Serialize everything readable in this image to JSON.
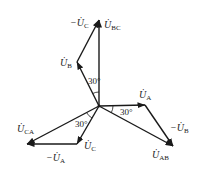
{
  "diagram": {
    "type": "phasor-diagram",
    "origin": [
      99,
      106
    ],
    "vectors": [
      {
        "id": "U_BC",
        "from": [
          99,
          106
        ],
        "to": [
          99,
          20
        ],
        "label_main": "U̇",
        "label_sub": "BC",
        "label_pos": [
          104,
          28
        ]
      },
      {
        "id": "U_B",
        "from": [
          99,
          106
        ],
        "to": [
          77,
          62
        ],
        "label_main": "U̇",
        "label_sub": "B",
        "label_pos": [
          60,
          66
        ]
      },
      {
        "id": "neg_U_C",
        "from": [
          77,
          62
        ],
        "to": [
          99,
          20
        ],
        "label_main": "−U̇",
        "label_sub": "C",
        "label_pos": [
          70,
          26
        ]
      },
      {
        "id": "U_A",
        "from": [
          99,
          106
        ],
        "to": [
          145,
          105
        ],
        "label_main": "U̇",
        "label_sub": "A",
        "label_pos": [
          139,
          98
        ]
      },
      {
        "id": "U_AB",
        "from": [
          99,
          106
        ],
        "to": [
          173,
          146
        ],
        "label_main": "U̇",
        "label_sub": "AB",
        "label_pos": [
          152,
          158
        ]
      },
      {
        "id": "neg_U_B",
        "from": [
          145,
          105
        ],
        "to": [
          173,
          146
        ],
        "label_main": "−U̇",
        "label_sub": "B",
        "label_pos": [
          170,
          131
        ]
      },
      {
        "id": "U_C",
        "from": [
          99,
          106
        ],
        "to": [
          77,
          144
        ],
        "label_main": "U̇",
        "label_sub": "C",
        "label_pos": [
          84,
          149
        ]
      },
      {
        "id": "U_CA",
        "from": [
          99,
          106
        ],
        "to": [
          27,
          144
        ],
        "label_main": "U̇",
        "label_sub": "CA",
        "label_pos": [
          17,
          132
        ]
      },
      {
        "id": "neg_U_A",
        "from": [
          77,
          144
        ],
        "to": [
          27,
          144
        ],
        "label_main": "−U̇",
        "label_sub": "A",
        "label_pos": [
          46,
          161
        ]
      }
    ],
    "angles": [
      {
        "label": "30°",
        "between": [
          "U_B",
          "U_BC"
        ],
        "pos": [
          88,
          84
        ]
      },
      {
        "label": "30°",
        "between": [
          "U_A",
          "U_AB"
        ],
        "pos": [
          120,
          115
        ]
      },
      {
        "label": "30°",
        "between": [
          "U_C",
          "U_CA"
        ],
        "pos": [
          75,
          127
        ]
      }
    ]
  }
}
